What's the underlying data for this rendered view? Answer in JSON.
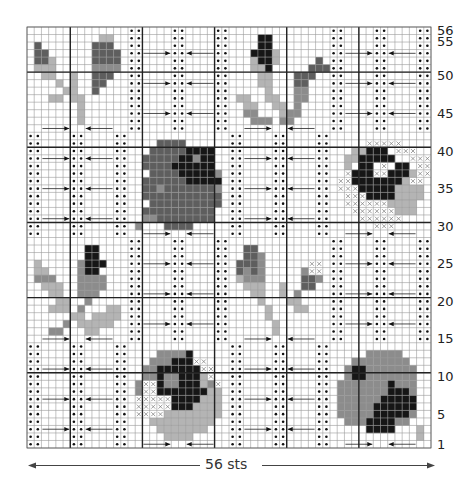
{
  "chart_data": {
    "type": "knitting-chart",
    "title": "",
    "stitches": 56,
    "rows": 56,
    "width_label": "56 sts",
    "row_labels": [
      {
        "row": 56,
        "text": "56"
      },
      {
        "row": 55,
        "text": "55"
      },
      {
        "row": 50,
        "text": "50"
      },
      {
        "row": 45,
        "text": "45"
      },
      {
        "row": 40,
        "text": "40"
      },
      {
        "row": 35,
        "text": "35"
      },
      {
        "row": 30,
        "text": "30"
      },
      {
        "row": 25,
        "text": "25"
      },
      {
        "row": 20,
        "text": "20"
      },
      {
        "row": 15,
        "text": "15"
      },
      {
        "row": 10,
        "text": "10"
      },
      {
        "row": 5,
        "text": "5"
      },
      {
        "row": 1,
        "text": "1"
      }
    ],
    "thick_lines_every": 10,
    "block_size": 14,
    "colors": {
      "light": "#b4b4b4",
      "mid": "#8c8c8c",
      "dark": "#5e5e5e",
      "black": "#161616",
      "grid": "#9a9a9a",
      "thick": "#222222"
    },
    "legend_codes": {
      "0": "background (white)",
      "1": "light gray",
      "2": "mid gray",
      "3": "dark gray",
      "4": "black",
      "x": "cross stitch symbol",
      "•": "purl dot"
    },
    "block_layout": [
      [
        "leafL",
        "tex",
        "budTR",
        "tex"
      ],
      [
        "tex",
        "rose1",
        "tex",
        "rose2"
      ],
      [
        "tex_budL",
        "tex",
        "budM",
        "tex"
      ],
      [
        "tex",
        "rose3",
        "tex",
        "rose4"
      ]
    ],
    "texture": {
      "dot_cols": [
        0,
        1,
        6,
        7,
        12,
        13
      ],
      "arrow_rows": [
        3,
        7,
        11
      ],
      "right_arrow_cols": [
        2,
        5
      ],
      "left_arrow_cols": [
        8,
        11
      ]
    },
    "motif_arrow_row": 13,
    "motifs": {
      "leafL": [
        "00000000000000",
        "00000000001100",
        "03000000033300",
        "03300000033330",
        "03310000033330",
        "01110000022220",
        "00110010033300",
        "00001010033000",
        "00000110030000",
        "00011011000000",
        "00000001000000",
        "00000001000000",
        "00000001000000",
        "00000000000000"
      ],
      "budTR": [
        "00000000000000",
        "00004400000000",
        "00004400000000",
        "00044410000000",
        "00014410000030",
        "00011400000333",
        "00001100033300",
        "00001100033000",
        "00000100022000",
        "01100110022000",
        "00110011020000",
        "00220001220000",
        "00022202200000",
        "00000000000000"
      ],
      "rose1": [
        "00000000000000",
        "00003333000000",
        "00033333444400",
        "00333334424400",
        "00333344444400",
        "00033334444420",
        "00333333444440",
        "00332333333320",
        "00333333333330",
        "00033333333330",
        "00333333333300",
        "00223333333300",
        "02000333300000",
        "00000000000000"
      ],
      "rose2": [
        "00000000000000",
        "00000xxxxx0000",
        "000114440xxx00",
        "00114444400xxx",
        "0010440x0440xx",
        "00x444xx4441xx",
        "0xx44444441xx0",
        "0xxx4444411110",
        "00xxx444411110",
        "00xxxxxx111100",
        "000xxxxxx11100",
        "0000xxxxxx0000",
        "000000xxx00000",
        "00000000000000"
      ],
      "budL": [
        "00000000000000",
        "00000000440000",
        "00000000440000",
        "01000002444000",
        "01100002440000",
        "02220002222000",
        "00111002222000",
        "00011002220000",
        "00001100200000",
        "00011102000110",
        "00000011011110",
        "00000201111100",
        "00022000110000",
        "00000000000000"
      ],
      "budM": [
        "00000000000000",
        "00330000000000",
        "00332000000000",
        "03332000000xx0",
        "03232000002xx0",
        "01222000003320",
        "00111001003300",
        "00011001020000",
        "00001000110000",
        "00000100011000",
        "00000100000000",
        "00000010000000",
        "00000010000000",
        "00000000000000"
      ],
      "rose3": [
        "00000000000000",
        "00002222400000",
        "000222444xx000",
        "0022444444xx00",
        "00224224441x00",
        "02xx42244412x0",
        "02xx4444444110",
        "0xxxxx44441110",
        "0xxxxx44411110",
        "0xxxx111111110",
        "00011111111100",
        "00001111111000",
        "00000111100000",
        "00000000000000"
      ],
      "rose4": [
        "00000000000000",
        "00000222220000",
        "00022222222000",
        "00244222222200",
        "00244222222200",
        "02222222422200",
        "02222222444200",
        "02222224444400",
        "02222244444400",
        "02222244444200",
        "00222444422000",
        "00000444400010",
        "00000000000010",
        "00000000000000"
      ]
    }
  }
}
